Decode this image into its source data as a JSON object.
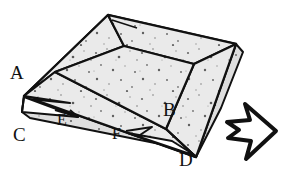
{
  "figure": {
    "colors": {
      "background": "#ffffff",
      "paper_fill": "#eaeaea",
      "paper_fill_shadow": "#d8d8d8",
      "stroke": "#111111",
      "speckle": "#5b5b5b",
      "label_text": "#111111"
    },
    "labels": [
      {
        "id": "A",
        "text": "A",
        "x": 10,
        "y": 79,
        "size": "large"
      },
      {
        "id": "B",
        "text": "B",
        "x": 163,
        "y": 116,
        "size": "large"
      },
      {
        "id": "C",
        "text": "C",
        "x": 13,
        "y": 141,
        "size": "large"
      },
      {
        "id": "D",
        "text": "D",
        "x": 179,
        "y": 166,
        "size": "large"
      },
      {
        "id": "E",
        "text": "E",
        "x": 57,
        "y": 125,
        "size": "small"
      },
      {
        "id": "F",
        "text": "F",
        "x": 112,
        "y": 139,
        "size": "small"
      }
    ],
    "arrow": {
      "name": "direction-arrow",
      "points": "245,104 276,131 246,159 251,141 228,138 239,130 227,122 250,120",
      "stroke_color": "#111111",
      "fill": "#ffffff",
      "direction": "right"
    }
  }
}
